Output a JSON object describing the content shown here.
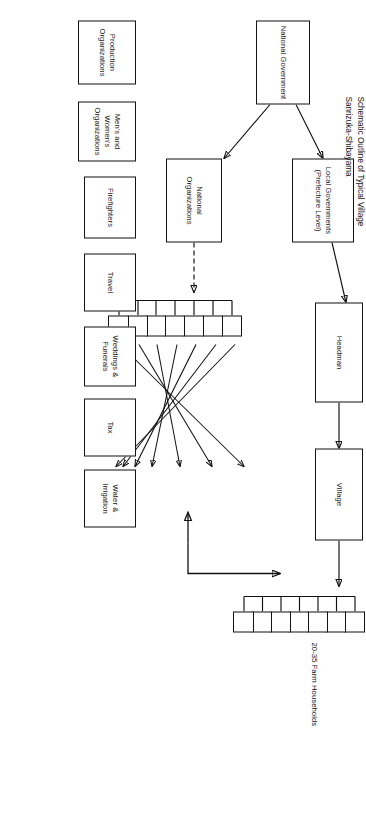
{
  "figure": {
    "title_line1": "Schematic Outline of Typical Village",
    "title_line2": "Sanrizuka-Shibayama",
    "households_caption": "20-35 Farm Households"
  },
  "nodes": {
    "national_government": "National Government",
    "local_governments": "Local Governments\n(Prefecture Level)",
    "headman": "Headman",
    "village": "Village",
    "national_organizations": "National Organizations",
    "water_irrigation": "Water &\nIrrigation",
    "tax": "Tax",
    "weddings_funerals": "Weddings &\nFunerals",
    "travel": "Travel",
    "firefighters": "Firefighters",
    "mens_womens_organizations": "Men's and\nWomen's\nOrganizations",
    "production_organizations": "Production\nOrganizations"
  },
  "household_boxes": {
    "count": 7,
    "labels": [
      "",
      "",
      "",
      "",
      "",
      "",
      ""
    ]
  },
  "group_boxes": {
    "count": 7,
    "labels": [
      "",
      "",
      "",
      "",
      "",
      "",
      ""
    ]
  },
  "colors": {
    "stroke": "#111111",
    "background": "#ffffff",
    "text": "#111111"
  }
}
